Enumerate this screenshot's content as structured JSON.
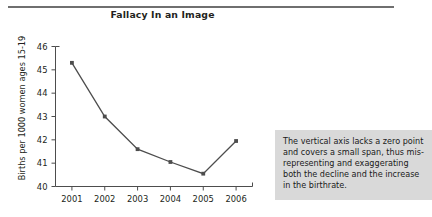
{
  "figure": {
    "title": "Fallacy In an Image",
    "caption": "The vertical axis lacks a zero point\nand covers a small span, thus mis-\nrepresenting and exaggerating\nboth the decline and the increase\nin the birthrate.",
    "rule_color": "#6f6f6f",
    "caption_bg": "#d9d9d9"
  },
  "chart_data": {
    "type": "line",
    "title": "Fallacy In an Image",
    "xlabel": "",
    "ylabel": "Births per 1000 women ages 15-19",
    "categories": [
      "2001",
      "2002",
      "2003",
      "2004",
      "2005",
      "2006"
    ],
    "x": [
      2001,
      2002,
      2003,
      2004,
      2005,
      2006
    ],
    "values": [
      45.3,
      43.0,
      41.6,
      41.05,
      40.55,
      41.95
    ],
    "ylim": [
      40,
      46
    ],
    "yticks": [
      40,
      41,
      42,
      43,
      44,
      45,
      46
    ],
    "ytick_labels": [
      "40",
      "41",
      "42",
      "43",
      "44",
      "45",
      "46"
    ],
    "xtick_labels": [
      "2001",
      "2002",
      "2003",
      "2004",
      "2005",
      "2006"
    ],
    "grid": false,
    "legend": false,
    "series": [
      {
        "name": "Births per 1000 women ages 15-19",
        "values": [
          45.3,
          43.0,
          41.6,
          41.05,
          40.55,
          41.95
        ],
        "color": "#4d4d4d",
        "marker": "square"
      }
    ],
    "annotations": [
      "The vertical axis lacks a zero point and covers a small span, thus misrepresenting and exaggerating both the decline and the increase in the birthrate."
    ]
  }
}
